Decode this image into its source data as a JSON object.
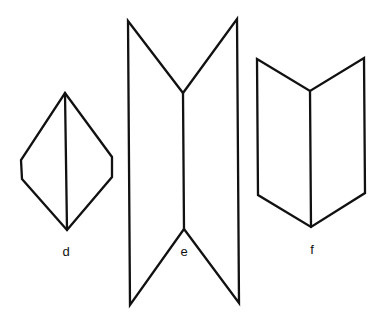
{
  "figures": [
    {
      "id": "d",
      "label": "d",
      "description": "diamond-like hexagon with vertical center fold line",
      "outline": [
        [
          65,
          93
        ],
        [
          112,
          157
        ],
        [
          112,
          177
        ],
        [
          67,
          230
        ],
        [
          22,
          179
        ],
        [
          21,
          160
        ]
      ],
      "fold_line": [
        [
          65,
          93
        ],
        [
          67,
          230
        ]
      ],
      "label_pos": [
        66,
        256
      ]
    },
    {
      "id": "e",
      "label": "e",
      "description": "tall folded panel with V-notches at top and bottom (concave fold)",
      "outline": [
        [
          128,
          21
        ],
        [
          183,
          93
        ],
        [
          237,
          19
        ],
        [
          239,
          303
        ],
        [
          184,
          229
        ],
        [
          130,
          305
        ]
      ],
      "fold_line": [
        [
          183,
          93
        ],
        [
          184,
          229
        ]
      ],
      "label_pos": [
        184,
        256
      ]
    },
    {
      "id": "f",
      "label": "f",
      "description": "open folder / book with center vertical fold (convex fold)",
      "outline": [
        [
          257,
          59
        ],
        [
          310,
          91
        ],
        [
          364,
          58
        ],
        [
          365,
          193
        ],
        [
          311,
          227
        ],
        [
          258,
          195
        ]
      ],
      "fold_line": [
        [
          310,
          91
        ],
        [
          311,
          227
        ]
      ],
      "label_pos": [
        312,
        254
      ]
    }
  ],
  "colors": {
    "background": "#ffffff",
    "line": "#111111"
  }
}
